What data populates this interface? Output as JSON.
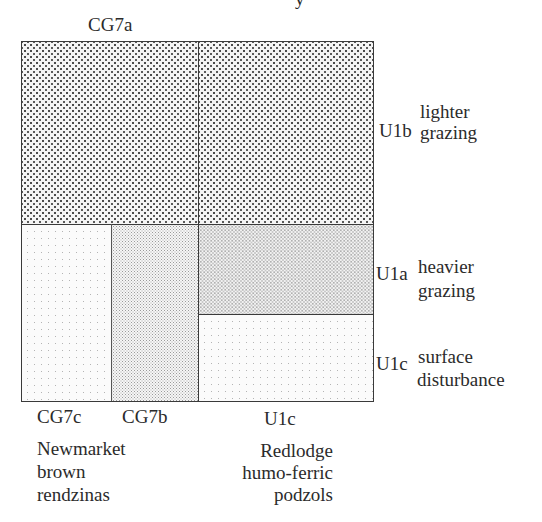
{
  "title_fragment": "y",
  "top_label": "CG7a",
  "regions": [
    {
      "id": "CG7a",
      "texture": "dense"
    },
    {
      "id": "U1b",
      "texture": "dense"
    },
    {
      "id": "CG7c",
      "texture": "sparse"
    },
    {
      "id": "CG7b",
      "texture": "fine"
    },
    {
      "id": "U1a",
      "texture": "medium"
    },
    {
      "id": "U1c",
      "texture": "sparse"
    }
  ],
  "right_labels": [
    {
      "code": "U1b",
      "line1": "lighter",
      "line2": "grazing"
    },
    {
      "code": "U1a",
      "line1": "heavier",
      "line2": "grazing"
    },
    {
      "code": "U1c",
      "line1": "surface",
      "line2": "disturbance"
    }
  ],
  "bottom_labels": {
    "cg7c": "CG7c",
    "cg7b": "CG7b",
    "u1c": "U1c"
  },
  "soil_groups": [
    {
      "lines": [
        "Newmarket",
        "brown",
        "rendzinas"
      ]
    },
    {
      "lines": [
        "Redlodge",
        "humo-ferric",
        "podzols"
      ]
    }
  ]
}
